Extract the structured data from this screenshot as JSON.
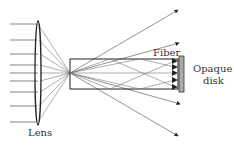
{
  "diagram": {
    "labels": {
      "lens": "Lens",
      "fiber": "Fiber",
      "disk_line1": "Opaque",
      "disk_line2": "disk"
    },
    "colors": {
      "line": "#555555",
      "dark_line": "#222222",
      "disk_fill": "#aaaaaa",
      "background": "#ffffff"
    },
    "components": [
      "incoming parallel rays",
      "converging lens",
      "focal point",
      "optical fiber",
      "opaque disk",
      "escaping rays"
    ]
  }
}
